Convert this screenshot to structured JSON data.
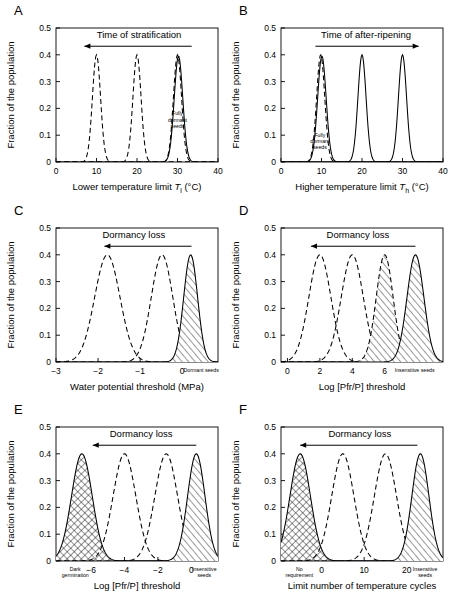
{
  "figure": {
    "ylabel": "Fraction of the population",
    "yticks": [
      "0",
      "0.1",
      "0.2",
      "0.3",
      "0.4",
      "0.5"
    ],
    "ylim": [
      0,
      0.5
    ]
  },
  "chart_data": [
    {
      "type": "line",
      "panel": "A",
      "letter": "A",
      "title": "",
      "xlabel": "Lower temperature limit T l (°C)",
      "xlabel_parts": {
        "pre": "Lower temperature limit ",
        "italic": "T",
        "sub": "l",
        "post": " (°C)"
      },
      "ylabel": "Fraction of the population",
      "xlim": [
        0,
        40
      ],
      "ylim": [
        0,
        0.5
      ],
      "xticks": [
        0,
        10,
        20,
        30,
        40
      ],
      "xticklabels": [
        "0",
        "10",
        "20",
        "30",
        "40"
      ],
      "yticks": [
        0,
        0.1,
        0.2,
        0.3,
        0.4,
        0.5
      ],
      "yticklabels": [
        "0",
        "0.1",
        "0.2",
        "0.3",
        "0.4",
        "0.5"
      ],
      "annotation": {
        "text": "Time of stratification",
        "arrow": "left",
        "x_text": 20.5,
        "y_text": 0.463,
        "arrow_x1": 33.5,
        "arrow_x2": 7.0,
        "arrow_y": 0.432
      },
      "series": [
        {
          "name": "stratified-late",
          "mean": 10,
          "sd": 1.0,
          "amplitude": 0.4,
          "style": "dashed",
          "fill": "none"
        },
        {
          "name": "stratified-mid",
          "mean": 20,
          "sd": 1.0,
          "amplitude": 0.4,
          "style": "dashed",
          "fill": "none"
        },
        {
          "name": "fully-dormant-dashed",
          "mean": 30,
          "sd": 1.0,
          "amplitude": 0.4,
          "style": "dashed",
          "fill": "none"
        },
        {
          "name": "fully-dormant-solid",
          "mean": 30.25,
          "sd": 1.05,
          "amplitude": 0.395,
          "style": "solid",
          "fill": "none"
        }
      ],
      "inline_labels": [
        {
          "text": [
            "Fully",
            "dormant",
            "seeds"
          ],
          "x": 30,
          "y": 0.175,
          "size": "small"
        }
      ],
      "grid": false,
      "legend": "none"
    },
    {
      "type": "line",
      "panel": "B",
      "letter": "B",
      "title": "",
      "xlabel": "Higher temperature limit T h (°C)",
      "xlabel_parts": {
        "pre": "Higher temperature limit ",
        "italic": "T",
        "sub": "h",
        "post": " (°C)"
      },
      "ylabel": "Fraction of the population",
      "xlim": [
        0,
        40
      ],
      "ylim": [
        0,
        0.5
      ],
      "xticks": [
        0,
        10,
        20,
        30,
        40
      ],
      "xticklabels": [
        "0",
        "10",
        "20",
        "30",
        "40"
      ],
      "yticks": [
        0,
        0.1,
        0.2,
        0.3,
        0.4,
        0.5
      ],
      "yticklabels": [
        "0",
        "0.1",
        "0.2",
        "0.3",
        "0.4",
        "0.5"
      ],
      "annotation": {
        "text": "Time of after-ripening",
        "arrow": "right",
        "x_text": 21,
        "y_text": 0.463,
        "arrow_x1": 8.5,
        "arrow_x2": 34.0,
        "arrow_y": 0.432
      },
      "series": [
        {
          "name": "fully-dormant-dashed",
          "mean": 9.8,
          "sd": 1.0,
          "amplitude": 0.4,
          "style": "dashed",
          "fill": "none"
        },
        {
          "name": "fully-dormant-solid",
          "mean": 10.1,
          "sd": 1.05,
          "amplitude": 0.395,
          "style": "solid",
          "fill": "none"
        },
        {
          "name": "after-ripened-mid",
          "mean": 20,
          "sd": 1.0,
          "amplitude": 0.4,
          "style": "solid",
          "fill": "none"
        },
        {
          "name": "after-ripened-late",
          "mean": 30,
          "sd": 1.0,
          "amplitude": 0.4,
          "style": "solid",
          "fill": "none"
        }
      ],
      "inline_labels": [
        {
          "text": [
            "Fully",
            "dormant",
            "seeds"
          ],
          "x": 9.6,
          "y": 0.095,
          "size": "small"
        }
      ],
      "grid": false,
      "legend": "none"
    },
    {
      "type": "line",
      "panel": "C",
      "letter": "C",
      "title": "",
      "xlabel": "Water potential threshold (MPa)",
      "ylabel": "Fraction of the population",
      "xlim": [
        -3.0,
        0.85
      ],
      "ylim": [
        0,
        0.5
      ],
      "xticks": [
        -3,
        -2,
        -1,
        0
      ],
      "xticklabels": [
        "−3",
        "−2",
        "−1",
        "0"
      ],
      "yticks": [
        0,
        0.1,
        0.2,
        0.3,
        0.4,
        0.5
      ],
      "yticklabels": [
        "0",
        "0.1",
        "0.2",
        "0.3",
        "0.4",
        "0.5"
      ],
      "annotation": {
        "text": "Dormancy loss",
        "arrow": "left",
        "x_text": -1.15,
        "y_text": 0.463,
        "arrow_x1": 0.22,
        "arrow_x2": -1.85,
        "arrow_y": 0.432
      },
      "endlabels": {
        "right": "Dormant seeds",
        "right_x": 0.45
      },
      "series": [
        {
          "name": "non-dormant",
          "mean": -1.78,
          "sd": 0.3,
          "amplitude": 0.4,
          "style": "dashed",
          "fill": "none"
        },
        {
          "name": "intermediate",
          "mean": -0.48,
          "sd": 0.255,
          "amplitude": 0.4,
          "style": "dashed",
          "fill": "none"
        },
        {
          "name": "dormant-seeds",
          "mean": 0.2,
          "sd": 0.165,
          "amplitude": 0.4,
          "style": "solid",
          "fill": "hatch"
        }
      ],
      "inline_labels": [],
      "grid": false,
      "legend": "none"
    },
    {
      "type": "line",
      "panel": "D",
      "letter": "D",
      "title": "",
      "xlabel": "Log [Pfr/P] threshold",
      "ylabel": "Fraction of the population",
      "xlim": [
        -0.4,
        9.6
      ],
      "ylim": [
        0,
        0.5
      ],
      "xticks": [
        0,
        2,
        4,
        6
      ],
      "xticklabels": [
        "0",
        "2",
        "4",
        "6"
      ],
      "yticks": [
        0,
        0.1,
        0.2,
        0.3,
        0.4,
        0.5
      ],
      "yticklabels": [
        "0",
        "0.1",
        "0.2",
        "0.3",
        "0.4",
        "0.5"
      ],
      "annotation": {
        "text": "Dormancy loss",
        "arrow": "left",
        "x_text": 4.35,
        "y_text": 0.463,
        "arrow_x1": 7.9,
        "arrow_x2": 1.45,
        "arrow_y": 0.432
      },
      "endlabels": {
        "right": "Insensitive seeds",
        "right_x": 7.85
      },
      "series": [
        {
          "name": "non-dormant",
          "mean": 2.0,
          "sd": 0.68,
          "amplitude": 0.4,
          "style": "dashed",
          "fill": "none"
        },
        {
          "name": "intermediate",
          "mean": 4.0,
          "sd": 0.68,
          "amplitude": 0.4,
          "style": "dashed",
          "fill": "none"
        },
        {
          "name": "near-insensitive",
          "mean": 6.0,
          "sd": 0.52,
          "amplitude": 0.4,
          "style": "dashed",
          "fill": "hatch"
        },
        {
          "name": "insensitive-seeds",
          "mean": 7.9,
          "sd": 0.52,
          "amplitude": 0.4,
          "style": "solid",
          "fill": "hatch"
        }
      ],
      "inline_labels": [],
      "grid": false,
      "legend": "none"
    },
    {
      "type": "line",
      "panel": "E",
      "letter": "E",
      "title": "",
      "xlabel": "Log [Pfr/P] threshold",
      "ylabel": "Fraction of the population",
      "xlim": [
        -8.1,
        1.6
      ],
      "ylim": [
        0,
        0.5
      ],
      "xticks": [
        -6,
        -4,
        -2,
        0
      ],
      "xticklabels": [
        "−6",
        "−4",
        "−2",
        "0"
      ],
      "yticks": [
        0,
        0.1,
        0.2,
        0.3,
        0.4,
        0.5
      ],
      "yticklabels": [
        "0",
        "0.1",
        "0.2",
        "0.3",
        "0.4",
        "0.5"
      ],
      "annotation": {
        "text": "Dormancy loss",
        "arrow": "left",
        "x_text": -3.0,
        "y_text": 0.463,
        "arrow_x1": 0.3,
        "arrow_x2": -5.9,
        "arrow_y": 0.432
      },
      "endlabels": {
        "left": [
          "Dark",
          "germination"
        ],
        "left_x": -6.95,
        "right": [
          "Insensitive",
          "seeds"
        ],
        "right_x": 0.78
      },
      "series": [
        {
          "name": "dark-germination",
          "mean": -6.55,
          "sd": 0.62,
          "amplitude": 0.4,
          "style": "solid",
          "fill": "crosshatch"
        },
        {
          "name": "intermediate-1",
          "mean": -4.0,
          "sd": 0.68,
          "amplitude": 0.4,
          "style": "dashed",
          "fill": "none"
        },
        {
          "name": "intermediate-2",
          "mean": -1.5,
          "sd": 0.68,
          "amplitude": 0.4,
          "style": "dashed",
          "fill": "none"
        },
        {
          "name": "insensitive-seeds",
          "mean": 0.3,
          "sd": 0.52,
          "amplitude": 0.4,
          "style": "solid",
          "fill": "hatch"
        }
      ],
      "inline_labels": [],
      "grid": false,
      "legend": "none"
    },
    {
      "type": "line",
      "panel": "F",
      "letter": "F",
      "title": "",
      "xlabel": "Limit number of temperature cycles",
      "ylabel": "Fraction of the population",
      "xlim": [
        -9.5,
        28.5
      ],
      "ylim": [
        0,
        0.5
      ],
      "xticks": [
        0,
        10,
        20
      ],
      "xticklabels": [
        "0",
        "10",
        "20"
      ],
      "yticks": [
        0,
        0.1,
        0.2,
        0.3,
        0.4,
        0.5
      ],
      "yticklabels": [
        "0",
        "0.1",
        "0.2",
        "0.3",
        "0.4",
        "0.5"
      ],
      "annotation": {
        "text": "Dormancy loss",
        "arrow": "left",
        "x_text": 9.0,
        "y_text": 0.463,
        "arrow_x1": 22.5,
        "arrow_x2": -5.0,
        "arrow_y": 0.432
      },
      "endlabels": {
        "left": [
          "No",
          "requirement"
        ],
        "left_x": -5.2,
        "right": [
          "Insensitive",
          "seeds"
        ],
        "right_x": 24.3
      },
      "series": [
        {
          "name": "no-requirement",
          "mean": -5.0,
          "sd": 2.4,
          "amplitude": 0.4,
          "style": "solid",
          "fill": "crosshatch"
        },
        {
          "name": "intermediate-1",
          "mean": 5.0,
          "sd": 2.6,
          "amplitude": 0.4,
          "style": "dashed",
          "fill": "none"
        },
        {
          "name": "intermediate-2",
          "mean": 15.0,
          "sd": 2.6,
          "amplitude": 0.4,
          "style": "dashed",
          "fill": "none"
        },
        {
          "name": "insensitive-seeds",
          "mean": 23.2,
          "sd": 2.0,
          "amplitude": 0.4,
          "style": "solid",
          "fill": "hatch"
        }
      ],
      "inline_labels": [],
      "grid": false,
      "legend": "none"
    }
  ]
}
